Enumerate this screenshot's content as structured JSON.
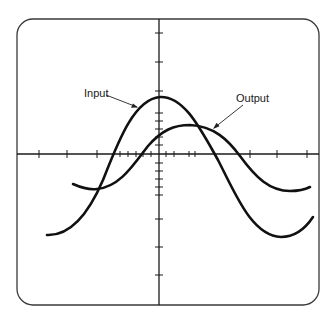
{
  "diagram": {
    "type": "oscilloscope-display",
    "labels": {
      "input": "Input",
      "output": "Output"
    },
    "colors": {
      "trace": "#111111",
      "frame": "#3a3a3a",
      "background": "#ffffff"
    },
    "traces": [
      {
        "name": "Input",
        "description": "larger amplitude sinusoid, peak near vertical axis"
      },
      {
        "name": "Output",
        "description": "smaller amplitude sinusoid, lagging (phase-shifted right) relative to input"
      }
    ]
  }
}
